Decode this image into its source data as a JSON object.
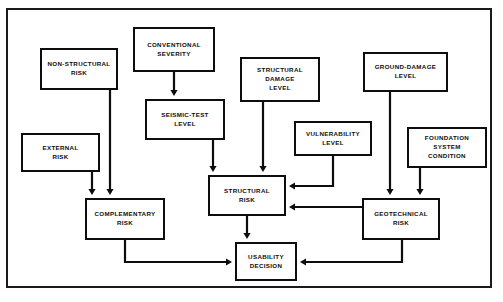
{
  "diagram": {
    "type": "flowchart",
    "frame": {
      "stroke": "#1a1a1a",
      "fill": "#ffffff"
    },
    "colors": {
      "box_stroke": "#0d0d0d",
      "box_fill": "#ffffff",
      "text": "#0d0d0d",
      "connector": "#0d0d0d"
    },
    "nodes": [
      {
        "id": "non_structural_risk",
        "label": "NON-STRUCTURAL\nRISK",
        "x": 40,
        "y": 48,
        "w": 78,
        "h": 42
      },
      {
        "id": "conventional_severity",
        "label": "CONVENTIONAL\nSEVERITY",
        "x": 133,
        "y": 27,
        "w": 82,
        "h": 45
      },
      {
        "id": "structural_damage_level",
        "label": "STRUCTURAL\nDAMAGE\nLEVEL",
        "x": 240,
        "y": 57,
        "w": 80,
        "h": 45
      },
      {
        "id": "ground_damage_level",
        "label": "GROUND-DAMAGE\nLEVEL",
        "x": 363,
        "y": 52,
        "w": 85,
        "h": 40
      },
      {
        "id": "seismic_test_level",
        "label": "SEISMIC-TEST\nLEVEL",
        "x": 145,
        "y": 99,
        "w": 80,
        "h": 41
      },
      {
        "id": "vulnerability_level",
        "label": "VULNERABILITY\nLEVEL",
        "x": 294,
        "y": 121,
        "w": 78,
        "h": 35
      },
      {
        "id": "foundation_system_condition",
        "label": "FOUNDATION\nSYSTEM\nCONDITION",
        "x": 407,
        "y": 127,
        "w": 80,
        "h": 41
      },
      {
        "id": "external_risk",
        "label": "EXTERNAL\nRISK",
        "x": 21,
        "y": 133,
        "w": 79,
        "h": 39
      },
      {
        "id": "structural_risk",
        "label": "STRUCTURAL\nRISK",
        "x": 208,
        "y": 175,
        "w": 78,
        "h": 41
      },
      {
        "id": "complementary_risk",
        "label": "COMPLEMENTARY\nRISK",
        "x": 85,
        "y": 198,
        "w": 80,
        "h": 42
      },
      {
        "id": "geotechnical_risk",
        "label": "GEOTECHNICAL\nRISK",
        "x": 362,
        "y": 198,
        "w": 78,
        "h": 42
      },
      {
        "id": "usability_decision",
        "label": "USABILITY\nDECISION",
        "x": 235,
        "y": 242,
        "w": 62,
        "h": 39
      }
    ],
    "edges": [
      {
        "id": "edge-conventional-severity-to-seismic-test-level",
        "from": "conventional_severity",
        "to": "seismic_test_level",
        "points": "174,72 174,96",
        "arrow": "down"
      },
      {
        "id": "edge-non-structural-risk-to-complementary-risk",
        "from": "non_structural_risk",
        "to": "complementary_risk",
        "points": "110,90 110,195",
        "arrow": "down"
      },
      {
        "id": "edge-external-risk-to-complementary-risk",
        "from": "external_risk",
        "to": "complementary_risk",
        "points": "92,172 92,195",
        "arrow": "down"
      },
      {
        "id": "edge-seismic-test-level-to-structural-risk",
        "from": "seismic_test_level",
        "to": "structural_risk",
        "points": "213,140 213,172",
        "arrow": "down"
      },
      {
        "id": "edge-structural-damage-level-to-structural-risk",
        "from": "structural_damage_level",
        "to": "structural_risk",
        "points": "263,102 263,172",
        "arrow": "down"
      },
      {
        "id": "edge-vulnerability-level-to-structural-risk",
        "from": "vulnerability_level",
        "to": "structural_risk",
        "points": "333,156 333,186 289,186",
        "arrow": "left"
      },
      {
        "id": "edge-geotechnical-risk-to-structural-risk",
        "from": "geotechnical_risk",
        "to": "structural_risk",
        "points": "362,207 289,207",
        "arrow": "left"
      },
      {
        "id": "edge-ground-damage-level-to-geotechnical-risk",
        "from": "ground_damage_level",
        "to": "geotechnical_risk",
        "points": "390,92 390,195",
        "arrow": "down"
      },
      {
        "id": "edge-foundation-system-condition-to-geotechnical-risk",
        "from": "foundation_system_condition",
        "to": "geotechnical_risk",
        "points": "420,168 420,195",
        "arrow": "down"
      },
      {
        "id": "edge-structural-risk-to-usability-decision",
        "from": "structural_risk",
        "to": "usability_decision",
        "points": "247,216 247,239",
        "arrow": "down"
      },
      {
        "id": "edge-complementary-risk-to-usability-decision",
        "from": "complementary_risk",
        "to": "usability_decision",
        "points": "125,240 125,262 232,262",
        "arrow": "right"
      },
      {
        "id": "edge-geotechnical-risk-to-usability-decision",
        "from": "geotechnical_risk",
        "to": "usability_decision",
        "points": "402,240 402,262 300,262",
        "arrow": "left"
      }
    ]
  }
}
